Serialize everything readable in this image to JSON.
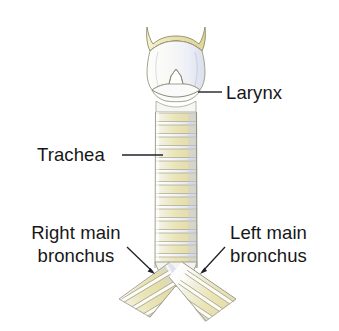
{
  "figure": {
    "background_color": "#ffffff",
    "width": 339,
    "height": 331
  },
  "palette": {
    "text": "#171719",
    "leader_line": "#20202a",
    "cartilage_yellow": "#e8e3b4",
    "cartilage_yellow_deep": "#d8d08a",
    "cartilage_pale": "#f7f7f4",
    "mucosa_blue": "#dfe2ee",
    "outline": "#8a8770",
    "outline_soft": "#b5b3a0",
    "shadow_blue": "#c8cde0"
  },
  "labels": {
    "larynx": {
      "text": "Larynx",
      "leader": "horizontal-line"
    },
    "trachea": {
      "text": "Trachea",
      "leader": "horizontal-line"
    },
    "right_main_bronchus": {
      "line1": "Right main",
      "line2": "bronchus",
      "leader": "arrow-down-right"
    },
    "left_main_bronchus": {
      "line1": "Left main",
      "line2": "bronchus",
      "leader": "arrow-down-left"
    }
  },
  "structures": [
    {
      "name": "thyroid-cartilage",
      "label": "Larynx",
      "description": "Superior horns and thyroid laminae with midline notch"
    },
    {
      "name": "cricoid-cartilage",
      "label": "Larynx",
      "description": "Lens shaped ring below the thyroid cartilage"
    },
    {
      "name": "trachea",
      "label": "Trachea",
      "description": "Tube of stacked C-shaped cartilage rings",
      "ring_count": 13
    },
    {
      "name": "carina",
      "label": "",
      "description": "Bifurcation point of the trachea"
    },
    {
      "name": "right-main-bronchus",
      "label": "Right main bronchus",
      "description": "Branch descending to the viewer's left",
      "ring_count": 7
    },
    {
      "name": "left-main-bronchus",
      "label": "Left main bronchus",
      "description": "Branch descending to the viewer's right",
      "ring_count": 8
    }
  ]
}
